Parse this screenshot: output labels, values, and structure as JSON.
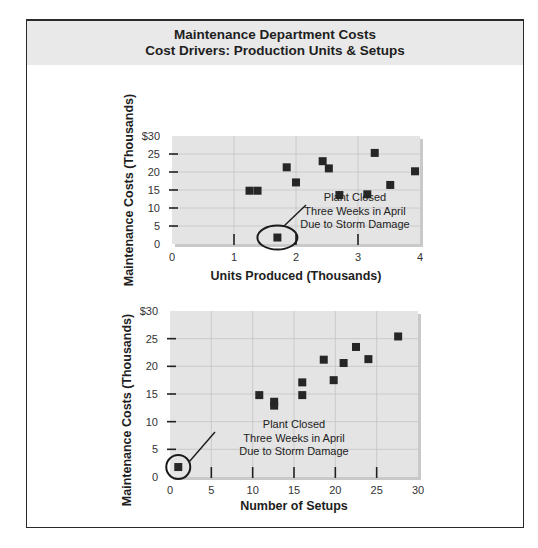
{
  "header": {
    "title": "Maintenance Department Costs",
    "subtitle": "Cost Drivers: Production Units & Setups"
  },
  "chart_data": [
    {
      "type": "scatter",
      "title": "Maintenance Department Costs — Cost Driver: Production Units",
      "xlabel": "Units Produced (Thousands)",
      "ylabel": "Maintenance Costs (Thousands)",
      "xlim": [
        0,
        4
      ],
      "ylim": [
        0,
        30
      ],
      "x_ticks": [
        "0",
        "1",
        "2",
        "3",
        "4"
      ],
      "y_ticks": [
        "0",
        "5",
        "10",
        "15",
        "20",
        "25",
        "$30"
      ],
      "grid": true,
      "points": [
        {
          "x": 1.25,
          "y": 14.8
        },
        {
          "x": 1.38,
          "y": 14.8
        },
        {
          "x": 1.85,
          "y": 21.3
        },
        {
          "x": 2.0,
          "y": 17.1
        },
        {
          "x": 2.43,
          "y": 23.0
        },
        {
          "x": 2.53,
          "y": 21.0
        },
        {
          "x": 2.7,
          "y": 13.6
        },
        {
          "x": 3.15,
          "y": 13.8
        },
        {
          "x": 3.27,
          "y": 25.3
        },
        {
          "x": 3.52,
          "y": 16.4
        },
        {
          "x": 3.92,
          "y": 20.2
        },
        {
          "x": 1.7,
          "y": 1.8
        }
      ],
      "annotation": {
        "lines": [
          "Plant Closed",
          "Three Weeks in April",
          "Due to Storm Damage"
        ],
        "circled_point": {
          "x": 1.7,
          "y": 1.8
        }
      }
    },
    {
      "type": "scatter",
      "title": "Maintenance Department Costs — Cost Driver: Setups",
      "xlabel": "Number of Setups",
      "ylabel": "Maintenance Costs (Thousands)",
      "xlim": [
        0,
        30
      ],
      "ylim": [
        0,
        30
      ],
      "x_ticks": [
        "0",
        "5",
        "10",
        "15",
        "20",
        "25",
        "30"
      ],
      "y_ticks": [
        "0",
        "5",
        "10",
        "15",
        "20",
        "25",
        "$30"
      ],
      "grid": true,
      "points": [
        {
          "x": 10.8,
          "y": 14.8
        },
        {
          "x": 12.6,
          "y": 13.6
        },
        {
          "x": 12.6,
          "y": 12.9
        },
        {
          "x": 16.0,
          "y": 17.1
        },
        {
          "x": 16.0,
          "y": 14.8
        },
        {
          "x": 18.6,
          "y": 21.2
        },
        {
          "x": 19.8,
          "y": 17.5
        },
        {
          "x": 21.0,
          "y": 20.6
        },
        {
          "x": 22.5,
          "y": 23.5
        },
        {
          "x": 24.0,
          "y": 21.3
        },
        {
          "x": 27.6,
          "y": 25.4
        },
        {
          "x": 1.0,
          "y": 1.8
        }
      ],
      "annotation": {
        "lines": [
          "Plant Closed",
          "Three Weeks in April",
          "Due to Storm Damage"
        ],
        "circled_point": {
          "x": 1.0,
          "y": 1.8
        }
      }
    }
  ]
}
